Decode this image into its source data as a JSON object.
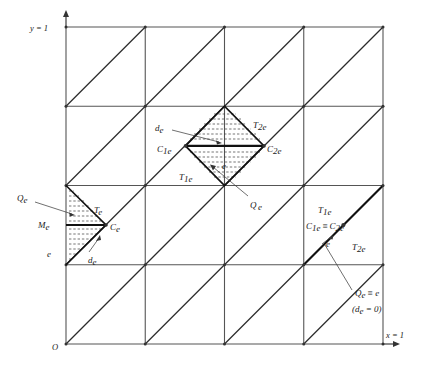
{
  "figure": {
    "axes": {
      "y_label": "y = 1",
      "x_label": "x = 1",
      "origin_label": "O"
    },
    "grid": {
      "divisions": 4,
      "x_min_px": 66,
      "x_max_px": 383,
      "y_min_px": 27,
      "y_max_px": 344,
      "cell_px": 79.25,
      "diagonal_direction": "bottom-left to top-right",
      "line_color": "#555555",
      "diagonal_color": "#2b2b2b"
    },
    "left_detail": {
      "name": "boundary-edge-detail",
      "labels": {
        "Qe": "Q",
        "Qe_sub": "e",
        "Te": "T",
        "Te_sub": "e",
        "Me": "M",
        "Me_sub": "e",
        "Ce": "C",
        "Ce_sub": "e",
        "e": "e",
        "de": "d",
        "de_sub": "e"
      }
    },
    "center_detail": {
      "name": "interior-edge-diamond-detail",
      "labels": {
        "de": "d",
        "de_sub": "e",
        "C1e": "C",
        "C1e_sub": "1e",
        "C2e": "C",
        "C2e_sub": "2e",
        "T1e": "T",
        "T1e_sub": "1e",
        "T2e": "T",
        "T2e_sub": "2e",
        "e": "e",
        "Qe": "Q",
        "Qe_sub": "e"
      }
    },
    "right_detail": {
      "name": "degenerate-edge-detail",
      "labels": {
        "T1e": "T",
        "T1e_sub": "1e",
        "T2e": "T",
        "T2e_sub": "2e",
        "C1e": "C",
        "C1e_sub": "1e",
        "equiv": "≡",
        "C2e": "C",
        "C2e_sub": "2e",
        "e": "e",
        "Qe": "Q",
        "Qe_sub": "e",
        "Qe_equiv_e": "≡ e",
        "de_zero_open": "(d",
        "de_zero_sub": "e",
        "de_zero_close": " = 0)"
      }
    },
    "colors": {
      "background": "#ffffff",
      "grid": "#555555",
      "diagonal": "#2b2b2b",
      "emphasis": "#111111",
      "hatch": "#3a3a3a",
      "text": "#1a1a1a"
    }
  }
}
